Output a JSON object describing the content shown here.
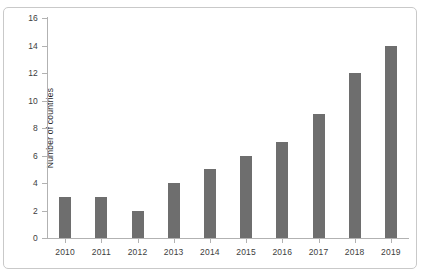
{
  "chart_data": {
    "type": "bar",
    "title": "",
    "subtitle": "",
    "xlabel": "",
    "ylabel": "Number of countries",
    "categories": [
      "2010",
      "2011",
      "2012",
      "2013",
      "2014",
      "2015",
      "2016",
      "2017",
      "2018",
      "2019"
    ],
    "values": [
      3,
      3,
      2,
      4,
      5,
      6,
      7,
      9,
      12,
      14
    ],
    "series": [
      {
        "name": "Number of countries",
        "values": [
          3,
          3,
          2,
          4,
          5,
          6,
          7,
          9,
          12,
          14
        ]
      }
    ],
    "ylim": [
      0,
      16
    ],
    "yticks": [
      0,
      2,
      4,
      6,
      8,
      10,
      12,
      14,
      16
    ],
    "ytick_labels": [
      "0",
      "2",
      "4",
      "6",
      "8",
      "10",
      "12",
      "14",
      "16"
    ],
    "xtick_labels": [
      "2010",
      "2011",
      "2012",
      "2013",
      "2014",
      "2015",
      "2016",
      "2017",
      "2018",
      "2019"
    ],
    "grid": false,
    "legend": false,
    "legend_position": "none",
    "annotations": [],
    "colors": {
      "bar": "#6e6e6e",
      "axis": "#b2b2b2",
      "text": "#3d3d3d",
      "frame": "#c9c9c9",
      "background": "#ffffff"
    }
  }
}
